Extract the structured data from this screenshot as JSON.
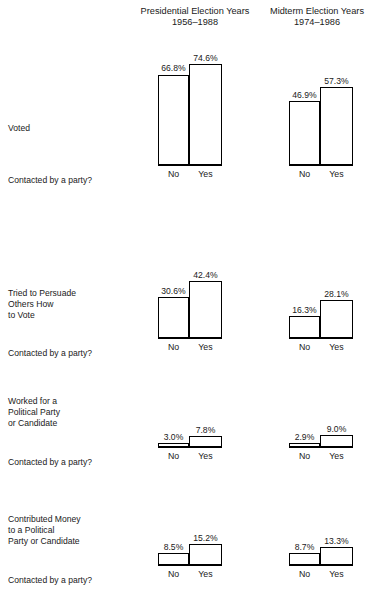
{
  "chart_data": {
    "type": "bar",
    "title": "",
    "xlabel": "Contacted by a party?",
    "ylabel": "",
    "ylim": [
      0,
      80
    ],
    "grid": false,
    "legend": "none",
    "categories": [
      "No",
      "Yes"
    ],
    "column_groups": [
      {
        "name": "presidential",
        "title_line1": "Presidential Election Years",
        "title_line2": "1956–1988"
      },
      {
        "name": "midterm",
        "title_line1": "Midterm Election Years",
        "title_line2": "1974–1986"
      }
    ],
    "panels": [
      {
        "row_label_lines": [
          "Voted"
        ],
        "axis_question": "Contacted by a party?",
        "groups": [
          {
            "group": "presidential",
            "values": [
              66.8,
              74.6
            ],
            "value_labels": [
              "66.8%",
              "74.6%"
            ]
          },
          {
            "group": "midterm",
            "values": [
              46.9,
              57.3
            ],
            "value_labels": [
              "46.9%",
              "57.3%"
            ]
          }
        ]
      },
      {
        "row_label_lines": [
          "Tried to Persuade",
          "Others How",
          "to Vote"
        ],
        "axis_question": "Contacted by a party?",
        "groups": [
          {
            "group": "presidential",
            "values": [
              30.6,
              42.4
            ],
            "value_labels": [
              "30.6%",
              "42.4%"
            ]
          },
          {
            "group": "midterm",
            "values": [
              16.3,
              28.1
            ],
            "value_labels": [
              "16.3%",
              "28.1%"
            ]
          }
        ]
      },
      {
        "row_label_lines": [
          "Worked for a",
          "Political Party",
          "or Candidate"
        ],
        "axis_question": "Contacted by a party?",
        "groups": [
          {
            "group": "presidential",
            "values": [
              3.0,
              7.8
            ],
            "value_labels": [
              "3.0%",
              "7.8%"
            ]
          },
          {
            "group": "midterm",
            "values": [
              2.9,
              9.0
            ],
            "value_labels": [
              "2.9%",
              "9.0%"
            ]
          }
        ]
      },
      {
        "row_label_lines": [
          "Contributed Money",
          "to a Political",
          "Party or Candidate"
        ],
        "axis_question": "Contacted by a party?",
        "groups": [
          {
            "group": "presidential",
            "values": [
              8.5,
              15.2
            ],
            "value_labels": [
              "8.5%",
              "15.2%"
            ]
          },
          {
            "group": "midterm",
            "values": [
              8.7,
              13.3
            ],
            "value_labels": [
              "8.7%",
              "13.3%"
            ]
          }
        ]
      }
    ]
  },
  "headers": {
    "presidential": {
      "line1": "Presidential Election Years",
      "line2": "1956–1988"
    },
    "midterm": {
      "line1": "Midterm Election Years",
      "line2": "1974–1986"
    }
  },
  "rows": [
    {
      "label_lines": [
        "Voted"
      ],
      "question": "Contacted by a party?"
    },
    {
      "label_lines": [
        "Tried to Persuade",
        "Others How",
        "to Vote"
      ],
      "question": "Contacted by a party?"
    },
    {
      "label_lines": [
        "Worked for a",
        "Political Party",
        "or Candidate"
      ],
      "question": "Contacted by a party?"
    },
    {
      "label_lines": [
        "Contributed Money",
        "to a Political",
        "Party or Candidate"
      ],
      "question": "Contacted by a party?"
    }
  ],
  "categories": {
    "no": "No",
    "yes": "Yes"
  },
  "colors": {
    "bar_fill": "#ffffff",
    "bar_stroke": "#000000",
    "text": "#1a1a1a",
    "background": "#ffffff"
  }
}
